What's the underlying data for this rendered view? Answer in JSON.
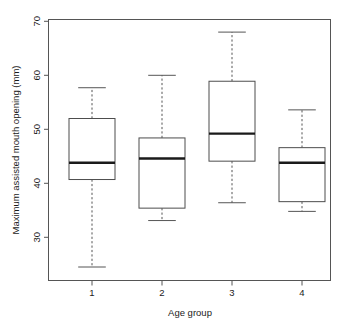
{
  "chart_data": {
    "type": "box",
    "title": "",
    "xlabel": "Age group",
    "ylabel": "Maximum assisted mouth opening (mm)",
    "categories": [
      "1",
      "2",
      "3",
      "4"
    ],
    "xtick_labels": [
      "1",
      "2",
      "3",
      "4"
    ],
    "ytick_labels": [
      "30",
      "40",
      "50",
      "60",
      "70"
    ],
    "ytick_values": [
      30,
      40,
      50,
      60,
      70
    ],
    "ylim": [
      24,
      70
    ],
    "grid": false,
    "legend": null,
    "boxes": [
      {
        "category": "1",
        "lower_whisker": 24.5,
        "q1": 40.7,
        "median": 43.8,
        "q3": 52.0,
        "upper_whisker": 57.7
      },
      {
        "category": "2",
        "lower_whisker": 33.1,
        "q1": 35.4,
        "median": 44.6,
        "q3": 48.4,
        "upper_whisker": 60.0
      },
      {
        "category": "3",
        "lower_whisker": 36.4,
        "q1": 44.1,
        "median": 49.2,
        "q3": 58.9,
        "upper_whisker": 68.0
      },
      {
        "category": "4",
        "lower_whisker": 34.8,
        "q1": 36.6,
        "median": 43.8,
        "q3": 46.6,
        "upper_whisker": 53.6
      }
    ]
  },
  "axes": {
    "y_axis_title": "Maximum assisted mouth opening (mm)",
    "x_axis_title": "Age group",
    "y_ticks": [
      {
        "label": "70",
        "value": 70
      },
      {
        "label": "60",
        "value": 60
      },
      {
        "label": "50",
        "value": 50
      },
      {
        "label": "40",
        "value": 40
      },
      {
        "label": "30",
        "value": 30
      }
    ],
    "x_ticks": [
      {
        "label": "1",
        "value": 1
      },
      {
        "label": "2",
        "value": 2
      },
      {
        "label": "3",
        "value": 3
      },
      {
        "label": "4",
        "value": 4
      }
    ]
  },
  "colors": {
    "background": "#ffffff",
    "frame": "#555555",
    "box_stroke": "#4d4d4d",
    "median": "#1a1a1a",
    "text": "#1a1a1a"
  },
  "geometry": {
    "plot_left": 48,
    "plot_right": 331,
    "plot_top": 19,
    "plot_bottom": 281,
    "y_value_at_top_px": 70,
    "px_per_unit": 5.4,
    "y_px_at_50": 129.3,
    "box_width": 46,
    "box_centers_px": [
      92,
      162,
      232,
      302
    ]
  }
}
